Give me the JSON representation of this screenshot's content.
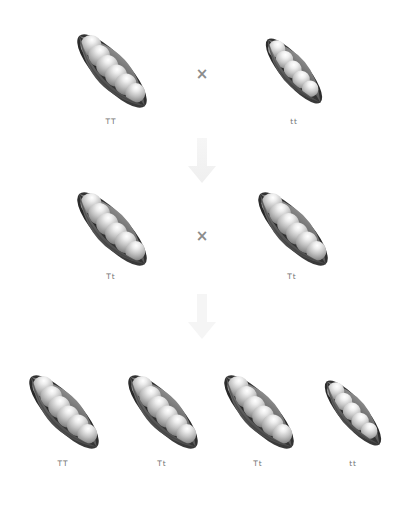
{
  "diagram": {
    "background_color": "#ffffff",
    "label_color": "#6f6f6f",
    "cross_symbol_color": "#8c8c8c",
    "arrow_color": "#f2f2f2",
    "pod_colors": {
      "outer_dark": "#4a4a4a",
      "outer_mid": "#7d7d7d",
      "inner_shadow": "#2f2f2f",
      "pea_light": "#ffffff",
      "pea_mid": "#c9c9c9",
      "pea_dark": "#8a8a8a"
    },
    "generations": [
      {
        "name": "parental",
        "organisms": [
          {
            "genotype": "TT",
            "size": "large",
            "peas": 6
          },
          {
            "genotype": "tt",
            "size": "small",
            "peas": 5
          }
        ],
        "operator": "×"
      },
      {
        "name": "f1",
        "organisms": [
          {
            "genotype": "Tt",
            "size": "large",
            "peas": 6
          },
          {
            "genotype": "Tt",
            "size": "large",
            "peas": 6
          }
        ],
        "operator": "×"
      },
      {
        "name": "f2",
        "organisms": [
          {
            "genotype": "TT",
            "size": "large",
            "peas": 6
          },
          {
            "genotype": "Tt",
            "size": "large",
            "peas": 6
          },
          {
            "genotype": "Tt",
            "size": "large",
            "peas": 6
          },
          {
            "genotype": "tt",
            "size": "small",
            "peas": 5
          }
        ],
        "operator": ""
      }
    ],
    "arrows": [
      {
        "name": "parental-to-f1",
        "direction": "down"
      },
      {
        "name": "f1-to-f2",
        "direction": "down"
      }
    ]
  }
}
